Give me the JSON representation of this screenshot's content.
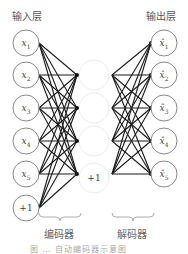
{
  "diagram": {
    "type": "autoencoder-network",
    "input_layer": {
      "title": "输入层",
      "nodes": [
        "x1",
        "x2",
        "x3",
        "x4",
        "x5",
        "+1"
      ]
    },
    "hidden_layer": {
      "nodes": [
        "h1",
        "h2",
        "h3",
        "h4"
      ],
      "bias": "+1"
    },
    "output_layer": {
      "title": "输出层",
      "nodes": [
        "x̂1",
        "x̂2",
        "x̂3",
        "x̂4",
        "x̂5"
      ]
    },
    "encoder_label": "编码器",
    "decoder_label": "解码器",
    "caption": "图 … 自动编码器示意图",
    "colors": {
      "node_stroke": "#8a8a8a",
      "hidden_stroke": "#ececec",
      "edge": "#1a1a1a",
      "text": "#444444"
    }
  }
}
